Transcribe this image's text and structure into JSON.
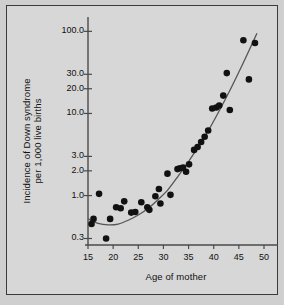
{
  "chart_data": {
    "type": "scatter",
    "title": "",
    "xlabel": "Age of mother",
    "ylabel_line1": "Incidence of Down syndrome",
    "ylabel_line2": "per 1,000 live births",
    "yscale": "log",
    "xscale": "linear",
    "xlim": [
      15,
      50
    ],
    "ylim": [
      0.25,
      130
    ],
    "grid": false,
    "legend": null,
    "xticks": [
      15,
      20,
      25,
      30,
      35,
      40,
      45,
      50
    ],
    "xticklabels": [
      "15",
      "20",
      "25",
      "30",
      "35",
      "40",
      "45",
      "50"
    ],
    "yticks": [
      0.3,
      1.0,
      2.0,
      3.0,
      10.0,
      20.0,
      30.0,
      100.0
    ],
    "yticklabels": [
      "0.3",
      "1.0",
      "2.0",
      "3.0",
      "10.0",
      "20.0",
      "30.0",
      "100.0"
    ],
    "marker": "filled-circle",
    "marker_color": "#111111",
    "curve_color": "#555555",
    "points": [
      {
        "x": 15.7,
        "y": 0.45
      },
      {
        "x": 16.1,
        "y": 0.52
      },
      {
        "x": 17.2,
        "y": 1.05
      },
      {
        "x": 18.6,
        "y": 0.3
      },
      {
        "x": 19.4,
        "y": 0.52
      },
      {
        "x": 20.6,
        "y": 0.72
      },
      {
        "x": 21.5,
        "y": 0.7
      },
      {
        "x": 22.2,
        "y": 0.85
      },
      {
        "x": 23.6,
        "y": 0.62
      },
      {
        "x": 24.4,
        "y": 0.63
      },
      {
        "x": 25.6,
        "y": 0.83
      },
      {
        "x": 26.8,
        "y": 0.72
      },
      {
        "x": 27.2,
        "y": 0.67
      },
      {
        "x": 28.4,
        "y": 0.98
      },
      {
        "x": 29.1,
        "y": 1.2
      },
      {
        "x": 29.4,
        "y": 0.8
      },
      {
        "x": 30.8,
        "y": 1.85
      },
      {
        "x": 31.4,
        "y": 1.02
      },
      {
        "x": 32.8,
        "y": 2.1
      },
      {
        "x": 33.3,
        "y": 2.15
      },
      {
        "x": 33.9,
        "y": 2.2
      },
      {
        "x": 34.5,
        "y": 1.95
      },
      {
        "x": 35.1,
        "y": 2.4
      },
      {
        "x": 36.1,
        "y": 3.6
      },
      {
        "x": 36.8,
        "y": 3.9
      },
      {
        "x": 37.5,
        "y": 4.5
      },
      {
        "x": 38.2,
        "y": 5.2
      },
      {
        "x": 38.9,
        "y": 6.2
      },
      {
        "x": 39.7,
        "y": 11.5
      },
      {
        "x": 40.5,
        "y": 11.8
      },
      {
        "x": 41.1,
        "y": 12.5
      },
      {
        "x": 41.9,
        "y": 16.5
      },
      {
        "x": 42.6,
        "y": 31.0
      },
      {
        "x": 43.2,
        "y": 11.0
      },
      {
        "x": 45.9,
        "y": 78.0
      },
      {
        "x": 47.0,
        "y": 26.0
      },
      {
        "x": 48.2,
        "y": 72.0
      }
    ],
    "fit_curve": [
      {
        "x": 15.0,
        "y": 0.52
      },
      {
        "x": 17.0,
        "y": 0.46
      },
      {
        "x": 19.0,
        "y": 0.44
      },
      {
        "x": 21.0,
        "y": 0.45
      },
      {
        "x": 23.0,
        "y": 0.5
      },
      {
        "x": 25.0,
        "y": 0.58
      },
      {
        "x": 27.0,
        "y": 0.7
      },
      {
        "x": 29.0,
        "y": 0.9
      },
      {
        "x": 31.0,
        "y": 1.2
      },
      {
        "x": 33.0,
        "y": 1.75
      },
      {
        "x": 35.0,
        "y": 2.6
      },
      {
        "x": 37.0,
        "y": 4.0
      },
      {
        "x": 39.0,
        "y": 6.3
      },
      {
        "x": 41.0,
        "y": 10.5
      },
      {
        "x": 43.0,
        "y": 18.0
      },
      {
        "x": 45.0,
        "y": 32.0
      },
      {
        "x": 47.0,
        "y": 58.0
      },
      {
        "x": 48.6,
        "y": 95.0
      }
    ]
  }
}
